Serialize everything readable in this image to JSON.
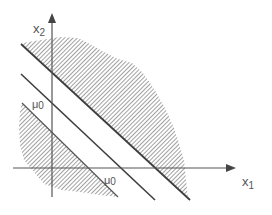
{
  "figure": {
    "axes": {
      "x_label_main": "x",
      "x_label_sub": "1",
      "y_label_main": "x",
      "y_label_sub": "2"
    },
    "annotations": {
      "mu_y_main": "μ",
      "mu_y_sub": "0",
      "mu_x_main": "μ",
      "mu_x_sub": "0"
    },
    "colors": {
      "line": "#444444",
      "axis": "#555555",
      "hatch": "#777777",
      "background": "#ffffff"
    }
  }
}
